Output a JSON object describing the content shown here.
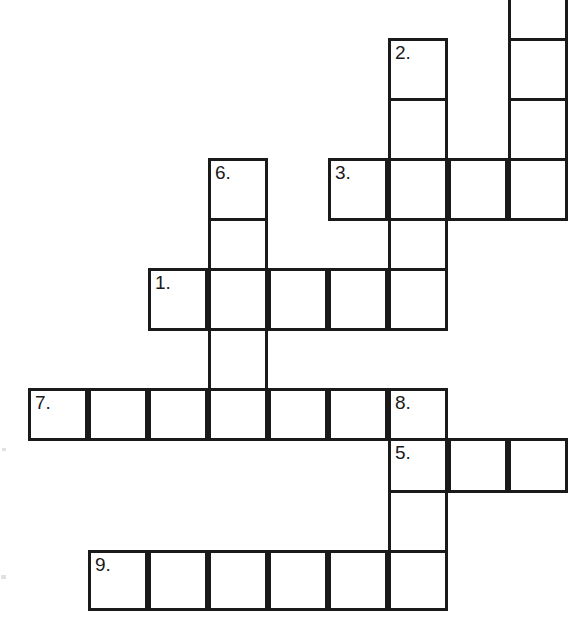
{
  "page": {
    "background_color": "#ffffff",
    "width": 583,
    "height": 639
  },
  "grid": {
    "cell_size": 60,
    "border_color": "#1a1a1a",
    "border_width": 3,
    "cell_fill": "#ffffff",
    "origin_x": 28,
    "origin_y": -22,
    "columns": 9,
    "rows": 11
  },
  "clue_numbers": {
    "n1": "1.",
    "n2": "2.",
    "n3": "3.",
    "n4": "4.",
    "n5": "5.",
    "n6": "6.",
    "n7": "7.",
    "n8": "8.",
    "n9": "9."
  },
  "entries": [
    {
      "number": "1.",
      "direction": "across",
      "start_col": 2,
      "start_row": 5,
      "length": 5
    },
    {
      "number": "2.",
      "direction": "down",
      "start_col": 6,
      "start_row": 1,
      "length": 3
    },
    {
      "number": "3.",
      "direction": "across",
      "start_col": 5,
      "start_row": 3,
      "length": 4
    },
    {
      "number": "4.",
      "direction": "down",
      "start_col": 8,
      "start_row": 0,
      "length": 4
    },
    {
      "number": "5.",
      "direction": "across",
      "start_col": 6,
      "start_row": 8,
      "length": 3
    },
    {
      "number": "6.",
      "direction": "down",
      "start_col": 3,
      "start_row": 3,
      "length": 5
    },
    {
      "number": "7.",
      "direction": "across",
      "start_col": 0,
      "start_row": 7,
      "length": 7
    },
    {
      "number": "8.",
      "direction": "down",
      "start_col": 6,
      "start_row": 7,
      "length": 4
    },
    {
      "number": "9.",
      "direction": "across",
      "start_col": 1,
      "start_row": 10,
      "length": 6
    }
  ],
  "cells": [
    {
      "name": "cell-c8-r0",
      "col": 8,
      "row": 0,
      "number": "4.",
      "letter": ""
    },
    {
      "name": "cell-c8-r1",
      "col": 8,
      "row": 1,
      "number": "",
      "letter": ""
    },
    {
      "name": "cell-c6-r1",
      "col": 6,
      "row": 1,
      "number": "2.",
      "letter": ""
    },
    {
      "name": "cell-c8-r2",
      "col": 8,
      "row": 2,
      "number": "",
      "letter": ""
    },
    {
      "name": "cell-c6-r2",
      "col": 6,
      "row": 2,
      "number": "",
      "letter": ""
    },
    {
      "name": "cell-c5-r3",
      "col": 5,
      "row": 3,
      "number": "3.",
      "letter": ""
    },
    {
      "name": "cell-c6-r3",
      "col": 6,
      "row": 3,
      "number": "",
      "letter": ""
    },
    {
      "name": "cell-c7-r3",
      "col": 7,
      "row": 3,
      "number": "",
      "letter": ""
    },
    {
      "name": "cell-c8-r3",
      "col": 8,
      "row": 3,
      "number": "",
      "letter": ""
    },
    {
      "name": "cell-c3-r3",
      "col": 3,
      "row": 3,
      "number": "6.",
      "letter": ""
    },
    {
      "name": "cell-c3-r4",
      "col": 3,
      "row": 4,
      "number": "",
      "letter": ""
    },
    {
      "name": "cell-c6-r4",
      "col": 6,
      "row": 4,
      "number": "",
      "letter": ""
    },
    {
      "name": "cell-c2-r5",
      "col": 2,
      "row": 5,
      "number": "1.",
      "letter": ""
    },
    {
      "name": "cell-c3-r5",
      "col": 3,
      "row": 5,
      "number": "",
      "letter": ""
    },
    {
      "name": "cell-c4-r5",
      "col": 4,
      "row": 5,
      "number": "",
      "letter": ""
    },
    {
      "name": "cell-c5-r5",
      "col": 5,
      "row": 5,
      "number": "",
      "letter": ""
    },
    {
      "name": "cell-c6-r5",
      "col": 6,
      "row": 5,
      "number": "",
      "letter": ""
    },
    {
      "name": "cell-c3-r6",
      "col": 3,
      "row": 6,
      "number": "",
      "letter": ""
    },
    {
      "name": "cell-c0-r7",
      "col": 0,
      "row": 7,
      "number": "7.",
      "letter": ""
    },
    {
      "name": "cell-c1-r7",
      "col": 1,
      "row": 7,
      "number": "",
      "letter": ""
    },
    {
      "name": "cell-c2-r7",
      "col": 2,
      "row": 7,
      "number": "",
      "letter": ""
    },
    {
      "name": "cell-c3-r7",
      "col": 3,
      "row": 7,
      "number": "",
      "letter": ""
    },
    {
      "name": "cell-c4-r7",
      "col": 4,
      "row": 7,
      "number": "",
      "letter": ""
    },
    {
      "name": "cell-c5-r7",
      "col": 5,
      "row": 7,
      "number": "",
      "letter": ""
    },
    {
      "name": "cell-c6-r7",
      "col": 6,
      "row": 7,
      "number": "8.",
      "letter": ""
    },
    {
      "name": "cell-c6-r8",
      "col": 6,
      "row": 8,
      "number": "5.",
      "letter": ""
    },
    {
      "name": "cell-c7-r8",
      "col": 7,
      "row": 8,
      "number": "",
      "letter": ""
    },
    {
      "name": "cell-c8-r8",
      "col": 8,
      "row": 8,
      "number": "",
      "letter": ""
    },
    {
      "name": "cell-c6-r9",
      "col": 6,
      "row": 9,
      "number": "",
      "letter": ""
    },
    {
      "name": "cell-c1-r10",
      "col": 1,
      "row": 10,
      "number": "9.",
      "letter": ""
    },
    {
      "name": "cell-c2-r10",
      "col": 2,
      "row": 10,
      "number": "",
      "letter": ""
    },
    {
      "name": "cell-c3-r10",
      "col": 3,
      "row": 10,
      "number": "",
      "letter": ""
    },
    {
      "name": "cell-c4-r10",
      "col": 4,
      "row": 10,
      "number": "",
      "letter": ""
    },
    {
      "name": "cell-c5-r10",
      "col": 5,
      "row": 10,
      "number": "",
      "letter": ""
    },
    {
      "name": "cell-c6-r10",
      "col": 6,
      "row": 10,
      "number": "",
      "letter": ""
    }
  ],
  "row_offsets": [
    -22,
    38,
    98,
    158,
    218,
    268,
    328,
    388,
    438,
    490,
    550
  ],
  "row_heights": [
    60,
    60,
    60,
    60,
    50,
    60,
    60,
    50,
    52,
    60,
    58
  ],
  "artifacts": [
    {
      "name": "speckle-left-upper",
      "x": 2,
      "y": 448,
      "w": 4,
      "h": 3
    },
    {
      "name": "speckle-left-lower",
      "x": 1,
      "y": 575,
      "w": 5,
      "h": 4
    }
  ]
}
